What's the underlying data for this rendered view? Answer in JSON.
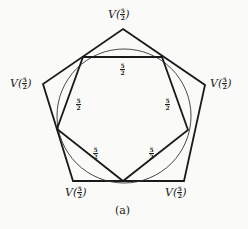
{
  "figure": {
    "caption": "(a)",
    "vertex_labels": [
      {
        "id": "top",
        "func": "V(",
        "num": "5",
        "den": "2",
        "close": ")"
      },
      {
        "id": "left",
        "func": "V(",
        "num": "5",
        "den": "2",
        "close": ")"
      },
      {
        "id": "right",
        "func": "V(",
        "num": "5",
        "den": "2",
        "close": ")"
      },
      {
        "id": "bottom-left",
        "func": "V(",
        "num": "5",
        "den": "2",
        "close": ")"
      },
      {
        "id": "bottom-right",
        "func": "V(",
        "num": "5",
        "den": "2",
        "close": ")"
      }
    ],
    "edge_labels": [
      {
        "id": "top",
        "num": "5",
        "den": "2"
      },
      {
        "id": "left",
        "num": "5",
        "den": "2"
      },
      {
        "id": "right",
        "num": "5",
        "den": "2"
      },
      {
        "id": "bottom-left",
        "num": "5",
        "den": "2"
      },
      {
        "id": "bottom-right",
        "num": "5",
        "den": "2"
      }
    ],
    "colors": {
      "stroke": "#1a1a1a",
      "background": "#fafaf8"
    }
  }
}
